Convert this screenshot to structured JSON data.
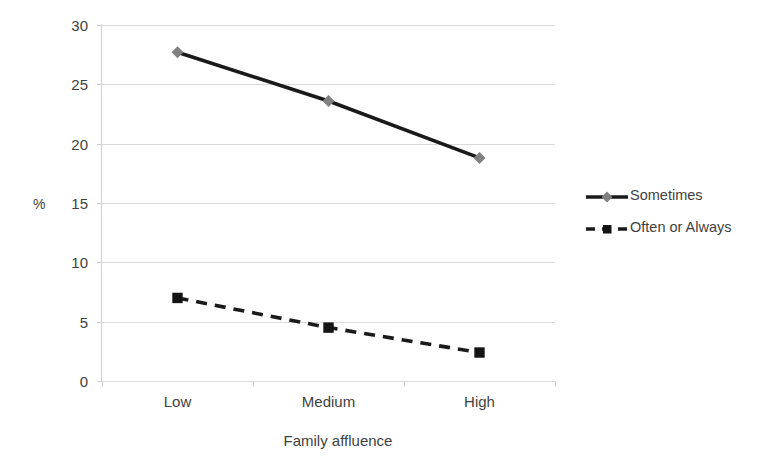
{
  "chart_data": {
    "type": "line",
    "title": "",
    "xlabel": "Family affluence",
    "ylabel": "%",
    "categories": [
      "Low",
      "Medium",
      "High"
    ],
    "series": [
      {
        "name": "Sometimes",
        "values": [
          27.7,
          23.6,
          18.8
        ],
        "line_style": "solid",
        "line_color": "#1a1a1a",
        "marker": "diamond",
        "marker_color": "#808080"
      },
      {
        "name": "Often or Always",
        "values": [
          7.0,
          4.5,
          2.4
        ],
        "line_style": "dashed",
        "line_color": "#1a1a1a",
        "marker": "square",
        "marker_color": "#141414"
      }
    ],
    "ylim": [
      0,
      30
    ],
    "yticks": [
      0,
      5,
      10,
      15,
      20,
      25,
      30
    ],
    "ytick_labels": [
      "0",
      "5",
      "10",
      "15",
      "20",
      "25",
      "30"
    ],
    "grid": true,
    "grid_color": "#d9d9d9",
    "legend_position": "right"
  },
  "axes": {
    "y_unit_label": "%",
    "x_title": "Family affluence"
  },
  "legend": {
    "entries": [
      {
        "label": "Sometimes"
      },
      {
        "label": "Often or Always"
      }
    ]
  }
}
